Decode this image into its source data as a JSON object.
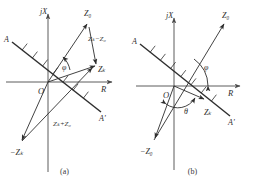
{
  "figure": {
    "subfigures": [
      {
        "caption": "(a)",
        "axes": {
          "real": "R",
          "imag": "jX",
          "origin": "O"
        },
        "boundary_line": {
          "start_label": "A",
          "end_label": "A'"
        },
        "angles": [
          {
            "name": "phi",
            "symbol": "φ"
          }
        ],
        "vectors": [
          {
            "name": "z0",
            "label": "Z₀"
          },
          {
            "name": "zk",
            "label": "Zₖ"
          },
          {
            "name": "minus-zk",
            "label": "−Zₖ"
          }
        ],
        "annotations": [
          {
            "name": "zk-minus-z0",
            "label": "Zₖ−Z₀"
          },
          {
            "name": "zk-plus-z0",
            "label": "Zₖ+Z₀"
          }
        ]
      },
      {
        "caption": "(b)",
        "axes": {
          "real": "R",
          "imag": "jX",
          "origin": "O"
        },
        "boundary_line": {
          "start_label": "A",
          "end_label": "A'"
        },
        "angles": [
          {
            "name": "phi",
            "symbol": "φ"
          },
          {
            "name": "theta",
            "symbol": "θ"
          }
        ],
        "vectors": [
          {
            "name": "z0",
            "label": "Z₀"
          },
          {
            "name": "zk",
            "label": "Zₖ"
          },
          {
            "name": "minus-z0",
            "label": "−Z₀"
          }
        ],
        "annotations": []
      }
    ],
    "colors": {
      "stroke": "#2e2e2e",
      "axis": "#4a4a4a",
      "background": "#ffffff"
    }
  }
}
